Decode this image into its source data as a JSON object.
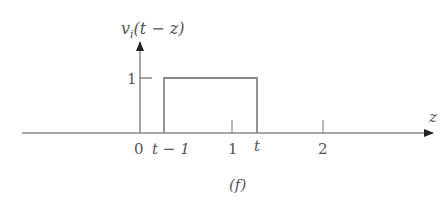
{
  "diagram": {
    "y_axis_label": "v_i(t − z)",
    "y_axis_label_base": "v",
    "y_axis_label_sub": "i",
    "y_axis_label_args": "(t − z)",
    "x_axis_label": "z",
    "y_tick_label": "1",
    "x_tick_labels": {
      "origin": "0",
      "t_minus_1": "t − 1",
      "one": "1",
      "t": "t",
      "two": "2"
    },
    "caption": "(f)",
    "pulse": {
      "from": "t − 1",
      "to": "t",
      "height": "1"
    },
    "colors": {
      "line": "#888888",
      "text": "#555555"
    }
  }
}
